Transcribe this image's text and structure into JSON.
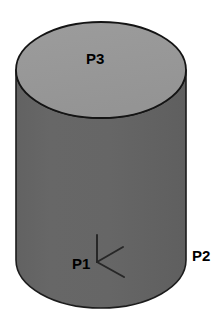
{
  "figure": {
    "background_color": "#ffffff",
    "shape": {
      "kind": "cylinder",
      "top_face_color": "#999999",
      "side_face_color": "#646464",
      "outline_color": "#1a1a1a",
      "outline_width": 1.6,
      "center_x": 101,
      "radius_x": 85,
      "radius_y": 48,
      "top_center_y": 70,
      "bottom_center_y": 260
    },
    "labels": [
      {
        "id": "P3",
        "text": "P3",
        "target": "top-circular-face"
      },
      {
        "id": "P1",
        "text": "P1",
        "target": "side-surface-left-of-axes"
      },
      {
        "id": "P2",
        "text": "P2",
        "target": "side-surface-right-outside"
      }
    ],
    "axes_marker": {
      "name": "coordinate-axes-triad",
      "color": "#262626",
      "line_width": 2,
      "origin": {
        "x": 97,
        "y": 262
      },
      "arms": [
        {
          "name": "axis-vertical-up",
          "to": {
            "x": 97,
            "y": 235
          }
        },
        {
          "name": "axis-upper-right",
          "to": {
            "x": 123,
            "y": 247
          }
        },
        {
          "name": "axis-lower-right",
          "to": {
            "x": 124,
            "y": 277
          }
        }
      ]
    }
  }
}
